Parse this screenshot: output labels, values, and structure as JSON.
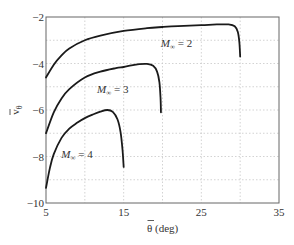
{
  "chart_data": {
    "type": "line",
    "title": "",
    "xlabel": "θ̄ (deg)",
    "ylabel": "v̄θ",
    "xlim": [
      5,
      35
    ],
    "ylim": [
      -10,
      -2
    ],
    "xticks": [
      5,
      15,
      25,
      35
    ],
    "yticks": [
      -2,
      -4,
      -6,
      -8,
      -10
    ],
    "xtick_labels": [
      "5",
      "15",
      "25",
      "35"
    ],
    "ytick_labels": [
      "−2",
      "−4",
      "−6",
      "−8",
      "−10"
    ],
    "grid": true,
    "grid_x": [
      10,
      15,
      20,
      25,
      30
    ],
    "grid_y": [
      -3,
      -4,
      -5,
      -6,
      -7,
      -8,
      -9
    ],
    "legend": "none (inline annotations)",
    "series": [
      {
        "name": "M∞ = 2",
        "x": [
          5,
          6,
          7,
          8,
          10,
          12,
          15,
          18,
          20,
          22,
          25,
          27,
          28.5,
          29.3,
          29.7,
          29.9,
          30.0
        ],
        "y": [
          -4.6,
          -4.05,
          -3.65,
          -3.35,
          -3.0,
          -2.8,
          -2.6,
          -2.48,
          -2.43,
          -2.39,
          -2.35,
          -2.32,
          -2.32,
          -2.4,
          -2.65,
          -3.1,
          -3.7
        ]
      },
      {
        "name": "M∞ = 3",
        "x": [
          5,
          6,
          7,
          8,
          10,
          12,
          14,
          15,
          16,
          17,
          18,
          18.8,
          19.3,
          19.6,
          19.75,
          19.8
        ],
        "y": [
          -7.0,
          -6.1,
          -5.5,
          -5.1,
          -4.6,
          -4.35,
          -4.2,
          -4.15,
          -4.08,
          -4.03,
          -4.02,
          -4.1,
          -4.35,
          -4.8,
          -5.5,
          -6.1
        ]
      },
      {
        "name": "M∞ = 4",
        "x": [
          5,
          5.5,
          6,
          7,
          8,
          9,
          10,
          11,
          12,
          12.9,
          13.6,
          14.2,
          14.6,
          14.85,
          15.0
        ],
        "y": [
          -9.35,
          -8.5,
          -7.9,
          -7.2,
          -6.8,
          -6.55,
          -6.35,
          -6.2,
          -6.07,
          -6.0,
          -6.08,
          -6.4,
          -6.95,
          -7.7,
          -8.45
        ]
      }
    ],
    "annotations": [
      {
        "text": "M∞ = 2",
        "label_main": "M",
        "label_sub": "∞",
        "label_rest": " = 2",
        "x": 21.8,
        "y": -3.1
      },
      {
        "text": "M∞ = 3",
        "label_main": "M",
        "label_sub": "∞",
        "label_rest": " = 3",
        "x": 13.6,
        "y": -5.1
      },
      {
        "text": "M∞ = 4",
        "label_main": "M",
        "label_sub": "∞",
        "label_rest": " = 4",
        "x": 9.0,
        "y": -7.9
      }
    ]
  },
  "axes": {
    "x_title_main": "θ",
    "x_title_unit": " (deg)",
    "y_title_main": "v",
    "y_title_sub": "θ"
  }
}
